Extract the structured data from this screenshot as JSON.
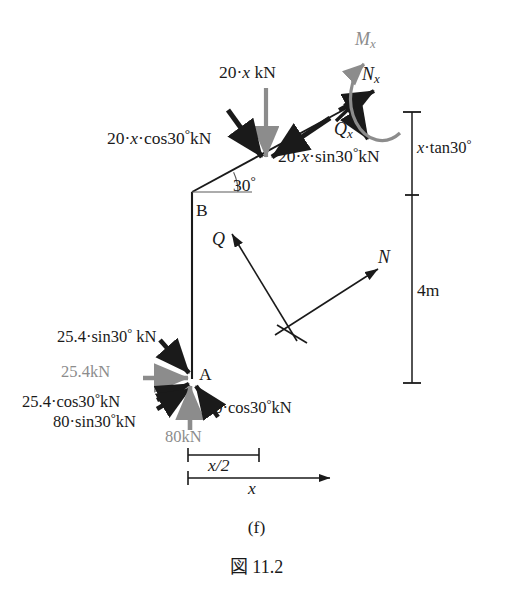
{
  "figure": {
    "caption_part": "(f)",
    "caption_number": "図 11.2"
  },
  "nodes": {
    "point_a": "A",
    "point_b": "B"
  },
  "angles": {
    "beam_inclination": "30",
    "degree_symbol": "°"
  },
  "loads": {
    "distributed_total": {
      "coef": "20",
      "dot1": "·",
      "var": "x",
      "unit": "kN"
    },
    "distributed_normal": {
      "text_a": "20",
      "dot1": "·",
      "var": "x",
      "dot2": "·",
      "fn": "cos30",
      "deg": "°",
      "unit": "kN"
    },
    "distributed_tangent": {
      "text_a": "20",
      "dot1": "·",
      "var": "x",
      "dot2": "·",
      "fn": "sin30",
      "deg": "°",
      "unit": "kN"
    },
    "reaction_h_resolved": {
      "value": "25.4",
      "dot": "·",
      "fn": "sin30",
      "deg": "°",
      "unit": " kN"
    },
    "reaction_h": {
      "value": "25.4",
      "unit": "kN"
    },
    "reaction_h_cos": {
      "value": "25.4",
      "dot": "·",
      "fn": "cos30",
      "deg": "°",
      "unit": "kN"
    },
    "reaction_v_sin": {
      "value": "80",
      "dot": "·",
      "fn": "sin30",
      "deg": "°",
      "unit": "kN"
    },
    "reaction_v_cos": {
      "value": "80",
      "dot": "·",
      "fn": "cos30",
      "deg": "°",
      "unit": "kN"
    },
    "reaction_v": {
      "value": "80",
      "unit": "kN"
    }
  },
  "internal_forces": {
    "shear_x": {
      "symbol": "Q",
      "sub": "x"
    },
    "axial_x": {
      "symbol": "N",
      "sub": "x"
    },
    "moment_x": {
      "symbol": "M",
      "sub": "x"
    },
    "shear": {
      "symbol": "Q"
    },
    "axial": {
      "symbol": "N"
    }
  },
  "dimensions": {
    "vertical_rise": {
      "var": "x",
      "dot": "·",
      "fn": "tan30",
      "deg": "°"
    },
    "column_height": "4m",
    "half_span": "x/2",
    "span": "x"
  },
  "colors": {
    "stroke_black": "#1a1a1a",
    "stroke_gray": "#8c8c8c",
    "background": "#ffffff"
  }
}
